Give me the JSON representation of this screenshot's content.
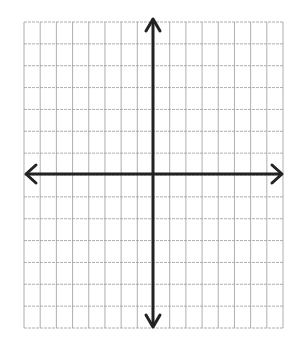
{
  "diagram": {
    "type": "coordinate-plane",
    "grid": {
      "columns": 16,
      "rows": 14,
      "left": 24,
      "top": 22,
      "right": 283,
      "bottom": 328,
      "line_color": "#9a9a9a"
    },
    "axes": {
      "x_axis_y": 174,
      "y_axis_x": 153,
      "color": "#222222",
      "arrows": [
        "left",
        "right",
        "up",
        "down"
      ]
    },
    "background": "#ffffff"
  }
}
